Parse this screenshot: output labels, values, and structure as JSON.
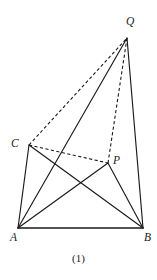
{
  "figure": {
    "caption": "(1)",
    "caption_x": 78,
    "caption_y": 252,
    "width": 157,
    "height": 280,
    "background_color": "#ffffff",
    "stroke_color": "#1a1a1a",
    "vertices": [
      {
        "id": "Q",
        "label": "Q",
        "x": 127,
        "y": 38,
        "label_x": 126,
        "label_y": 16
      },
      {
        "id": "C",
        "label": "C",
        "x": 29,
        "y": 145,
        "label_x": 11,
        "label_y": 138
      },
      {
        "id": "P",
        "label": "P",
        "x": 108,
        "y": 163,
        "label_x": 113,
        "label_y": 155
      },
      {
        "id": "A",
        "label": "A",
        "x": 18,
        "y": 228,
        "label_x": 10,
        "label_y": 232
      },
      {
        "id": "B",
        "label": "B",
        "x": 143,
        "y": 228,
        "label_x": 144,
        "label_y": 232
      }
    ],
    "edges": [
      {
        "id": "AB",
        "from": "A",
        "to": "B",
        "style": "solid",
        "weight": "base"
      },
      {
        "id": "AC",
        "from": "A",
        "to": "C",
        "style": "solid",
        "weight": "normal"
      },
      {
        "id": "AP",
        "from": "A",
        "to": "P",
        "style": "solid",
        "weight": "normal"
      },
      {
        "id": "AQ",
        "from": "A",
        "to": "Q",
        "style": "solid",
        "weight": "normal"
      },
      {
        "id": "CB",
        "from": "C",
        "to": "B",
        "style": "solid",
        "weight": "normal"
      },
      {
        "id": "PB",
        "from": "P",
        "to": "B",
        "style": "solid",
        "weight": "normal"
      },
      {
        "id": "BQ",
        "from": "B",
        "to": "Q",
        "style": "solid",
        "weight": "normal"
      },
      {
        "id": "CQ",
        "from": "C",
        "to": "Q",
        "style": "dashed",
        "weight": "normal"
      },
      {
        "id": "CP",
        "from": "C",
        "to": "P",
        "style": "dashed",
        "weight": "normal"
      },
      {
        "id": "PQ",
        "from": "P",
        "to": "Q",
        "style": "dashed",
        "weight": "normal"
      }
    ]
  }
}
